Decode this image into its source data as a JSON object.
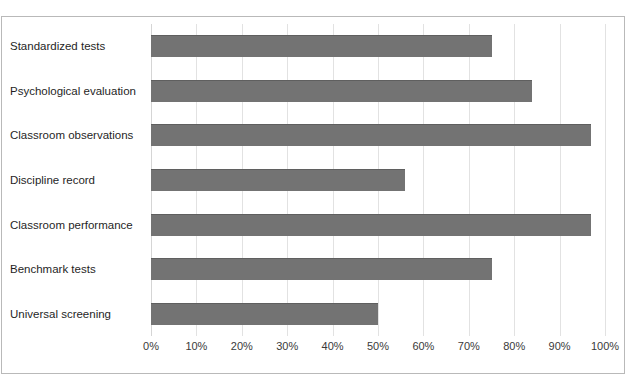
{
  "figure": {
    "title_fragment": "",
    "background_color": "#ffffff",
    "frame_color": "#b9b9b9"
  },
  "chart_data": {
    "type": "bar",
    "orientation": "horizontal",
    "title": "",
    "xlabel": "",
    "ylabel": "",
    "xlim": [
      0,
      100
    ],
    "xticks": [
      0,
      10,
      20,
      30,
      40,
      50,
      60,
      70,
      80,
      90,
      100
    ],
    "xtick_labels": [
      "0%",
      "10%",
      "20%",
      "30%",
      "40%",
      "50%",
      "60%",
      "70%",
      "80%",
      "90%",
      "100%"
    ],
    "grid": "vertical",
    "legend": "none",
    "bar_color": "#737373",
    "categories": [
      "Standardized tests",
      "Psychological evaluation",
      "Classroom observations",
      "Discipline record",
      "Classroom performance",
      "Benchmark tests",
      "Universal screening"
    ],
    "values": [
      75,
      84,
      97,
      56,
      97,
      75,
      50
    ],
    "value_labels": [
      "75%",
      "84%",
      "97%",
      "56%",
      "97%",
      "75%",
      "50%"
    ]
  }
}
